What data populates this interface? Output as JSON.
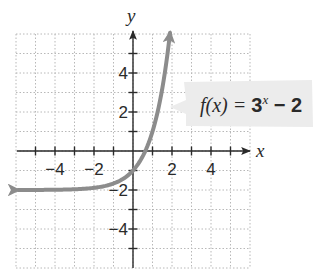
{
  "chart_data": {
    "type": "line",
    "title": "",
    "xlabel": "x",
    "ylabel": "y",
    "xlim": [
      -6,
      6
    ],
    "ylim": [
      -6,
      6
    ],
    "grid": true,
    "x_ticks": [
      -4,
      -2,
      2,
      4
    ],
    "y_ticks": [
      4,
      2,
      -2,
      -4
    ],
    "x_tick_labels": [
      "−4",
      "−2",
      "2",
      "4"
    ],
    "y_tick_labels": [
      "4",
      "2",
      "−2",
      "−4"
    ],
    "series": [
      {
        "name": "f(x) = 3^x − 2",
        "function": "3^x - 2",
        "color": "#8c8c8c",
        "x": [
          -5.9,
          -5,
          -4,
          -3,
          -2,
          -1,
          0,
          0.5,
          1,
          1.5,
          1.9
        ],
        "values": [
          -2.0,
          -1.996,
          -1.988,
          -1.963,
          -1.889,
          -1.667,
          -1,
          -0.268,
          1,
          3.196,
          6.06
        ],
        "arrows": "both",
        "horizontal_asymptote": -2
      }
    ],
    "annotations": [
      {
        "text": "f(x) = 3^x − 2",
        "position": "right of curve near y≈2"
      }
    ]
  },
  "labels": {
    "x_axis": "x",
    "y_axis": "y",
    "x_ticks": [
      "−4",
      "−2",
      "2",
      "4"
    ],
    "y_ticks": [
      "4",
      "2",
      "−2",
      "−4"
    ],
    "fn_prefix": "f(x) = ",
    "fn_base": "3",
    "fn_exp": "x",
    "fn_suffix": " − 2"
  }
}
